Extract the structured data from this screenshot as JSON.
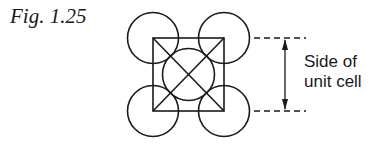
{
  "figure": {
    "label": "Fig. 1.25",
    "annotation": {
      "line1": "Side of",
      "line2": "unit cell"
    }
  },
  "diagram": {
    "stroke_color": "#1a1a1a",
    "square": {
      "x": 153,
      "y": 38,
      "size": 71
    },
    "corner_circle_radius": 25.5,
    "center_circle_radius": 25.5
  }
}
